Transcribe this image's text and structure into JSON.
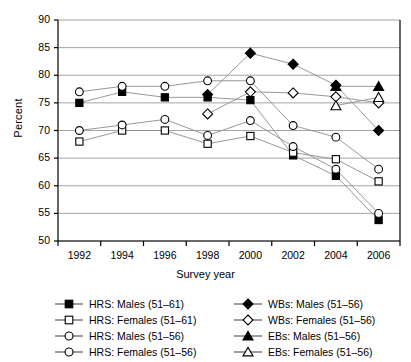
{
  "chart_data": {
    "type": "line",
    "title": "",
    "xlabel": "Survey year",
    "ylabel": "Percent",
    "categories": [
      1992,
      1994,
      1996,
      1998,
      2000,
      2002,
      2004,
      2006
    ],
    "x_tick_labels": [
      "1992",
      "1994",
      "1996",
      "1998",
      "2000",
      "2002",
      "2004",
      "2006"
    ],
    "y_tick_labels": [
      "50",
      "55",
      "60",
      "65",
      "70",
      "75",
      "80",
      "85",
      "90"
    ],
    "y_ticks": [
      50,
      55,
      60,
      65,
      70,
      75,
      80,
      85,
      90
    ],
    "ylim": [
      50,
      90
    ],
    "grid": "horizontal",
    "legend_position": "below-plot",
    "series": [
      {
        "name": "HRS: Males (51–61)",
        "marker": "filled-square",
        "x": [
          1992,
          1994,
          1996,
          1998,
          2000,
          2002,
          2004,
          2006
        ],
        "values": [
          75,
          77,
          76,
          76,
          75.5,
          65.5,
          61.8,
          53.8
        ]
      },
      {
        "name": "HRS: Females (51–61)",
        "marker": "open-square",
        "x": [
          1992,
          1994,
          1996,
          1998,
          2000,
          2002,
          2004,
          2006
        ],
        "values": [
          68,
          70,
          70,
          67.6,
          69,
          66,
          64.8,
          60.8
        ]
      },
      {
        "name": "HRS: Males (51–56)",
        "marker": "open-circle",
        "x": [
          1992,
          1994,
          1996,
          1998,
          2000,
          2002,
          2004,
          2006
        ],
        "values": [
          77,
          78,
          78,
          79,
          79,
          70.9,
          68.8,
          63
        ]
      },
      {
        "name": "HRS: Females (51–56)",
        "marker": "open-circle",
        "x": [
          1992,
          1994,
          1996,
          1998,
          2000,
          2002,
          2004,
          2006
        ],
        "values": [
          70,
          71,
          72,
          69.1,
          71.8,
          67.1,
          63,
          55
        ]
      },
      {
        "name": "WBs: Males (51–56)",
        "marker": "filled-diamond",
        "x": [
          1998,
          2000,
          2002,
          2004,
          2006
        ],
        "values": [
          76.5,
          84,
          82,
          78.2,
          70
        ]
      },
      {
        "name": "WBs: Females (51–56)",
        "marker": "open-diamond",
        "x": [
          1998,
          2000,
          2002,
          2004,
          2006
        ],
        "values": [
          73,
          77,
          76.8,
          76.1,
          75
        ]
      },
      {
        "name": "EBs: Males (51–56)",
        "marker": "filled-triangle",
        "x": [
          2004,
          2006
        ],
        "values": [
          78,
          78
        ]
      },
      {
        "name": "EBs: Females (51–56)",
        "marker": "open-triangle",
        "x": [
          2004,
          2006
        ],
        "values": [
          74.5,
          76
        ]
      }
    ]
  },
  "legend": {
    "entries": [
      {
        "label": "HRS: Males (51–61)",
        "marker": "filled-square"
      },
      {
        "label": "WBs: Males (51–56)",
        "marker": "filled-diamond"
      },
      {
        "label": "HRS: Females (51–61)",
        "marker": "open-square"
      },
      {
        "label": "WBs: Females (51–56)",
        "marker": "open-diamond"
      },
      {
        "label": "HRS: Males (51–56)",
        "marker": "open-circle"
      },
      {
        "label": "EBs: Males (51–56)",
        "marker": "filled-triangle"
      },
      {
        "label": "HRS: Females (51–56)",
        "marker": "open-circle"
      },
      {
        "label": "EBs: Females (51–56)",
        "marker": "open-triangle"
      }
    ]
  },
  "colors": {
    "axis": "#000000",
    "grid": "#9a9a9a",
    "line": "#8c8c8c",
    "marker_fill": "#000000",
    "marker_open": "#ffffff"
  }
}
